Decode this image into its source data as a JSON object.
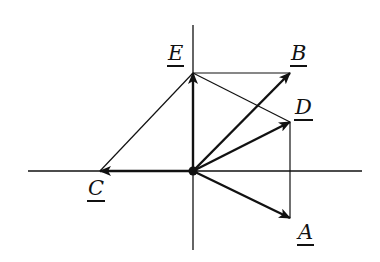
{
  "diagram": {
    "type": "vector-diagram",
    "origin": {
      "x": 193,
      "y": 171
    },
    "axes": {
      "horizontal": {
        "x1": 28,
        "x2": 362,
        "y": 171
      },
      "vertical": {
        "x": 193,
        "y1": 25,
        "y2": 250
      }
    },
    "vectors": [
      {
        "name": "A",
        "label": "A",
        "to": {
          "x": 290,
          "y": 218
        },
        "label_pos": {
          "x": 297,
          "y": 222
        }
      },
      {
        "name": "B",
        "label": "B",
        "to": {
          "x": 290,
          "y": 73
        },
        "label_pos": {
          "x": 290,
          "y": 43
        }
      },
      {
        "name": "C",
        "label": "C",
        "to": {
          "x": 100,
          "y": 171
        },
        "label_pos": {
          "x": 87,
          "y": 178
        }
      },
      {
        "name": "D",
        "label": "D",
        "to": {
          "x": 290,
          "y": 122
        },
        "label_pos": {
          "x": 294,
          "y": 97
        }
      },
      {
        "name": "E",
        "label": "E",
        "to": {
          "x": 193,
          "y": 73
        },
        "label_pos": {
          "x": 167,
          "y": 43
        }
      }
    ],
    "construction_lines": [
      {
        "from": "E",
        "to": "B"
      },
      {
        "from": "E",
        "to": "D"
      },
      {
        "from": "E",
        "to": "C"
      },
      {
        "from": "D",
        "to": "A"
      }
    ],
    "colors": {
      "stroke": "#111111",
      "background": "#ffffff"
    }
  }
}
